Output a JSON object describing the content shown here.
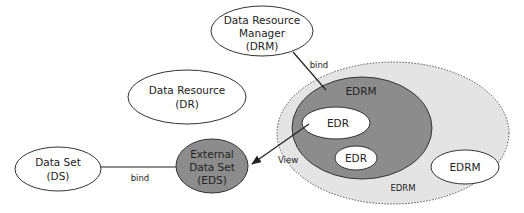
{
  "diagram": {
    "nodes": {
      "drm": {
        "lines": [
          "Data Resource",
          "Manager",
          "(DRM)"
        ]
      },
      "dr": {
        "lines": [
          "Data Resource",
          "(DR)"
        ]
      },
      "ds": {
        "lines": [
          "Data Set",
          "(DS)"
        ]
      },
      "eds": {
        "lines": [
          "External",
          "Data Set",
          "(EDS)"
        ]
      },
      "edrm_outer": {
        "label": "EDRM"
      },
      "edrm_inner": {
        "label": "EDRM"
      },
      "edr_1": {
        "label": "EDR"
      },
      "edr_2": {
        "label": "EDR"
      },
      "edrm_small": {
        "label": "EDRM"
      }
    },
    "edges": {
      "drm_bind": {
        "label": "bind"
      },
      "ds_eds_bind": {
        "label": "bind"
      },
      "view": {
        "label": "View"
      }
    },
    "colors": {
      "outer_fill": "#e4e4e4",
      "inner_fill": "#8c8c8c",
      "eds_fill": "#8c8c8c",
      "node_fill": "#ffffff",
      "stroke": "#333333"
    }
  }
}
